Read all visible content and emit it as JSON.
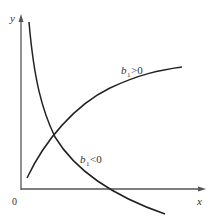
{
  "axes": {
    "y_label": "y",
    "x_label": "x",
    "origin_label": "0"
  },
  "curves": [
    {
      "name": "increasing",
      "label_var": "b",
      "label_sub": "1",
      "label_rel": ">0"
    },
    {
      "name": "decreasing",
      "label_var": "b",
      "label_sub": "1",
      "label_rel": "<0"
    }
  ],
  "colors": {
    "axis": "#555555",
    "curve": "#222222"
  }
}
